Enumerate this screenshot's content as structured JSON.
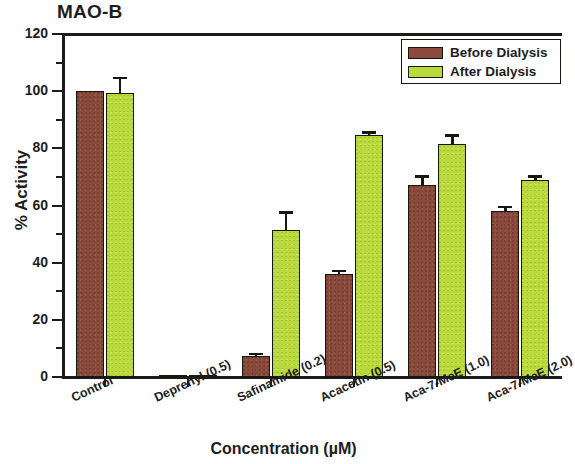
{
  "chart_data": {
    "type": "bar",
    "title": "MAO-B",
    "xlabel": "Concentration (µM)",
    "ylabel": "% Activity",
    "ylim": [
      0,
      120
    ],
    "ytick_step": 20,
    "yticks": [
      0,
      20,
      40,
      60,
      80,
      100,
      120
    ],
    "minor_ytick_step": 10,
    "grid": false,
    "legend_position": "top-right",
    "categories": [
      "Control",
      "Deprenyl (0.5)",
      "Safinamide (0.2)",
      "Acacetin (0.5)",
      "Aca-7-MeE (1.0)",
      "Aca-7-MeE (2.0)"
    ],
    "series": [
      {
        "name": "Before Dialysis",
        "color": "#8a4a3c",
        "values": [
          100,
          0.4,
          7.5,
          36,
          67,
          58
        ],
        "errors": [
          0,
          0,
          1.0,
          1.5,
          3.5,
          2.0
        ]
      },
      {
        "name": "After Dialysis",
        "color": "#bada3c",
        "values": [
          99.5,
          0.4,
          51.5,
          84.5,
          81.5,
          69
        ],
        "errors": [
          5.5,
          0,
          6.5,
          1.5,
          3.5,
          1.5
        ]
      }
    ]
  },
  "legend": {
    "items": [
      {
        "label": "Before Dialysis",
        "color": "#8a4a3c"
      },
      {
        "label": "After Dialysis",
        "color": "#bada3c"
      }
    ]
  }
}
